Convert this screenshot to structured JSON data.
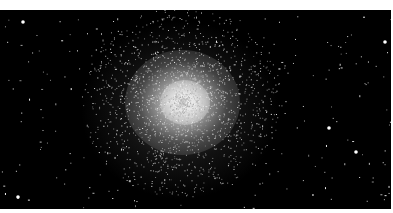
{
  "image": {
    "subject": "globular star cluster",
    "description": "Dense spherical cluster of stars against a black sky, brightest at center-left with scattered field stars",
    "colors": {
      "background": "#000000",
      "core": "#e6e6e6",
      "stars": "#ffffff",
      "border": "#ffffff"
    }
  }
}
